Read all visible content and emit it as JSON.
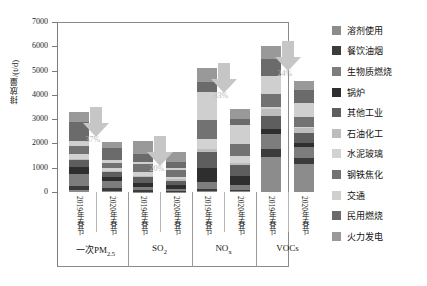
{
  "chart_data": {
    "type": "bar",
    "stacked": true,
    "title": "",
    "xlabel": "",
    "ylabel": "排放量/(t/d)",
    "ylim": [
      0,
      7000
    ],
    "yticks": [
      0,
      1000,
      2000,
      3000,
      4000,
      5000,
      6000,
      7000
    ],
    "grid": false,
    "legend_position": "right",
    "groups": [
      "一次PM2.5",
      "SO2",
      "NOx",
      "VOCs"
    ],
    "group_labels_html": [
      "一次PM<sub>2.5</sub>",
      "SO<sub>2</sub>",
      "NO<sub>x</sub>",
      "VOCs"
    ],
    "categories": [
      "2019年春节",
      "2020年春节",
      "2019年春节",
      "2020年春节",
      "2019年春节",
      "2020年春节",
      "2019年春节",
      "2020年春节"
    ],
    "series": [
      {
        "name": "溶剂使用",
        "color": "#8c8c8c",
        "values": [
          90,
          60,
          20,
          15,
          40,
          25,
          1450,
          1140
        ]
      },
      {
        "name": "餐饮油烟",
        "color": "#3b3b3b",
        "values": [
          170,
          105,
          60,
          45,
          75,
          50,
          330,
          250
        ]
      },
      {
        "name": "生物质燃烧",
        "color": "#7d7d7d",
        "values": [
          480,
          290,
          110,
          80,
          300,
          200,
          620,
          470
        ]
      },
      {
        "name": "锅炉",
        "color": "#2e2e2e",
        "values": [
          280,
          175,
          180,
          140,
          560,
          380,
          210,
          160
        ]
      },
      {
        "name": "其他工业",
        "color": "#5e5e5e",
        "values": [
          300,
          185,
          230,
          185,
          690,
          460,
          530,
          400
        ]
      },
      {
        "name": "石油化工",
        "color": "#bdbdbd",
        "values": [
          60,
          40,
          70,
          55,
          120,
          80,
          270,
          200
        ]
      },
      {
        "name": "水泥玻璃",
        "color": "#d2d2d2",
        "values": [
          180,
          115,
          150,
          120,
          410,
          275,
          90,
          70
        ]
      },
      {
        "name": "钢铁焦化",
        "color": "#727272",
        "values": [
          330,
          210,
          330,
          265,
          760,
          510,
          540,
          410
        ]
      },
      {
        "name": "交通",
        "color": "#cfcfcf",
        "values": [
          210,
          135,
          90,
          70,
          1180,
          790,
          760,
          575
        ]
      },
      {
        "name": "民用燃烧",
        "color": "#6b6b6b",
        "values": [
          790,
          490,
          330,
          260,
          380,
          255,
          690,
          520
        ]
      },
      {
        "name": "火力发电",
        "color": "#999999",
        "values": [
          410,
          255,
          530,
          425,
          585,
          395,
          510,
          385
        ]
      }
    ],
    "group_totals_2019": [
      3300,
      2100,
      5100,
      6000
    ],
    "group_totals_2020": [
      2060,
      1660,
      3420,
      4580
    ],
    "reduction_annotations": [
      {
        "group": "一次PM2.5",
        "label": "37%"
      },
      {
        "group": "SO2",
        "label": "20%"
      },
      {
        "group": "NOx",
        "label": "33%"
      },
      {
        "group": "VOCs",
        "label": "24%"
      }
    ],
    "arrow_color": "#c6c6c6"
  },
  "axis": {
    "y_title": "排放量/(t/d)",
    "tick_0": "0",
    "tick_1000": "1000",
    "tick_2000": "2000",
    "tick_3000": "3000",
    "tick_4000": "4000",
    "tick_5000": "5000",
    "tick_6000": "6000",
    "tick_7000": "7000"
  },
  "legend": {
    "items": [
      {
        "label": "溶剂使用",
        "color": "#8c8c8c"
      },
      {
        "label": "餐饮油烟",
        "color": "#3b3b3b"
      },
      {
        "label": "生物质燃烧",
        "color": "#7d7d7d"
      },
      {
        "label": "锅炉",
        "color": "#2e2e2e"
      },
      {
        "label": "其他工业",
        "color": "#5e5e5e"
      },
      {
        "label": "石油化工",
        "color": "#bdbdbd"
      },
      {
        "label": "水泥玻璃",
        "color": "#d2d2d2"
      },
      {
        "label": "钢铁焦化",
        "color": "#727272"
      },
      {
        "label": "交通",
        "color": "#cfcfcf"
      },
      {
        "label": "民用燃烧",
        "color": "#6b6b6b"
      },
      {
        "label": "火力发电",
        "color": "#999999"
      }
    ]
  }
}
